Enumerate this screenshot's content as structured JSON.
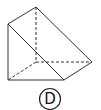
{
  "figure": {
    "type": "triangular-prism",
    "option_label": "D",
    "stroke_color": "#333333",
    "solid_edges": [
      [
        [
          36,
          7
        ],
        [
          8,
          24
        ]
      ],
      [
        [
          36,
          7
        ],
        [
          92,
          62
        ]
      ],
      [
        [
          8,
          24
        ],
        [
          8,
          80
        ]
      ],
      [
        [
          8,
          24
        ],
        [
          64,
          80
        ]
      ],
      [
        [
          8,
          80
        ],
        [
          64,
          80
        ]
      ],
      [
        [
          64,
          80
        ],
        [
          92,
          62
        ]
      ]
    ],
    "hidden_edges": [
      [
        [
          36,
          7
        ],
        [
          36,
          62
        ]
      ],
      [
        [
          36,
          62
        ],
        [
          92,
          62
        ]
      ],
      [
        [
          36,
          62
        ],
        [
          8,
          80
        ]
      ]
    ]
  }
}
